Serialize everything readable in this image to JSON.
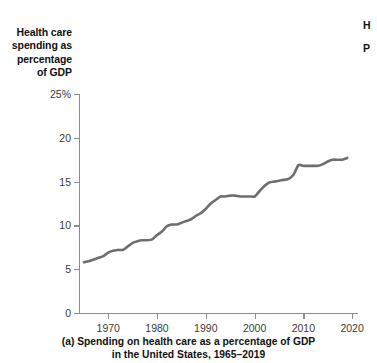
{
  "chart_data": {
    "type": "line",
    "title": "",
    "caption_line1": "(a) Spending on health care as a percentage of GDP",
    "caption_line2": "in the United States, 1965–2019",
    "ylabel": "Health care spending as percentage of GDP",
    "ylabel_lines": [
      "Health care",
      "spending as",
      "percentage",
      "of GDP"
    ],
    "xlabel": "",
    "xlim": [
      1964,
      2021
    ],
    "ylim": [
      0,
      25
    ],
    "grid": false,
    "legend": "none",
    "line_color": "#6e6e6e",
    "axis_color": "#8d8d8d",
    "ytick_labels": [
      "0",
      "5",
      "10",
      "15",
      "20",
      "25%"
    ],
    "ytick_values": [
      0,
      5,
      10,
      15,
      20,
      25
    ],
    "xtick_labels": [
      "1970",
      "1980",
      "1990",
      "2000",
      "2010",
      "2020"
    ],
    "xtick_values": [
      1970,
      1980,
      1990,
      2000,
      2010,
      2020
    ],
    "x": [
      1965,
      1966,
      1967,
      1968,
      1969,
      1970,
      1971,
      1972,
      1973,
      1974,
      1975,
      1976,
      1977,
      1978,
      1979,
      1980,
      1981,
      1982,
      1983,
      1984,
      1985,
      1986,
      1987,
      1988,
      1989,
      1990,
      1991,
      1992,
      1993,
      1994,
      1995,
      1996,
      1997,
      1998,
      1999,
      2000,
      2001,
      2002,
      2003,
      2004,
      2005,
      2006,
      2007,
      2008,
      2009,
      2010,
      2011,
      2012,
      2013,
      2014,
      2015,
      2016,
      2017,
      2018,
      2019
    ],
    "values": [
      5.8,
      5.9,
      6.1,
      6.3,
      6.5,
      6.9,
      7.1,
      7.2,
      7.2,
      7.6,
      8.0,
      8.2,
      8.3,
      8.3,
      8.4,
      8.9,
      9.3,
      9.9,
      10.1,
      10.1,
      10.3,
      10.5,
      10.7,
      11.1,
      11.4,
      11.9,
      12.5,
      12.9,
      13.3,
      13.3,
      13.4,
      13.4,
      13.3,
      13.3,
      13.3,
      13.3,
      13.9,
      14.5,
      14.9,
      15.0,
      15.1,
      15.2,
      15.3,
      15.8,
      16.9,
      16.8,
      16.8,
      16.8,
      16.8,
      17.0,
      17.3,
      17.5,
      17.5,
      17.5,
      17.7
    ],
    "series_note": "US national health expenditure as share of GDP"
  },
  "edge_fragments": {
    "frag1": "H",
    "frag2": "P"
  }
}
